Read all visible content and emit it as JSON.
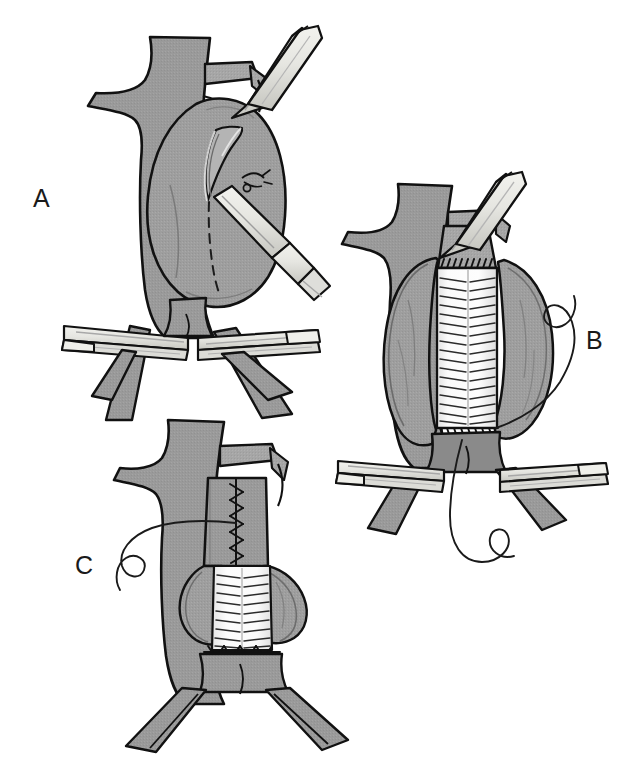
{
  "figure": {
    "background_color": "#ffffff",
    "width": 643,
    "height": 760,
    "style": "line-drawing medical illustration, grayscale"
  },
  "palette": {
    "vessel_fill": "#9a9a9a",
    "vessel_fill_light": "#a8a8a8",
    "vessel_shadow": "#8a8a8a",
    "sac_flap_fill": "#9e9e9e",
    "graft_fill": "#f6f6f6",
    "graft_shadow": "#d8d8d8",
    "instrument_fill": "#e8e8e4",
    "instrument_shadow": "#c9c9c4",
    "outline": "#111111",
    "suture": "#1a1a1a",
    "label_color": "#1a1a1a"
  },
  "panels": [
    {
      "id": "panel-a",
      "label": "A",
      "label_position": {
        "x": 33,
        "y": 186
      },
      "caption": "Aneurysm sac exposed with proximal aortic cross-clamp and bilateral iliac clamps; longitudinal aortotomy being made with scalpel along dashed incision line",
      "elements": [
        "proximal-aorta",
        "renal-artery-left",
        "renal-artery-right",
        "aneurysm-sac",
        "aortotomy-incision-dashed-line",
        "opened-aortotomy-edge",
        "scalpel",
        "proximal-aortic-clamp",
        "iliac-clamp-left",
        "iliac-clamp-right",
        "left-iliac-artery",
        "right-iliac-artery",
        "lumbar-vessel-ligature"
      ]
    },
    {
      "id": "panel-b",
      "label": "B",
      "label_position": {
        "x": 586,
        "y": 328
      },
      "caption": "Tube graft sewn in place inside the opened aneurysm sac; proximal and distal anastomoses completed with running suture, sac walls retracted laterally",
      "elements": [
        "proximal-aorta",
        "renal-artery-left",
        "renal-artery-right",
        "aneurysm-sac-flap-left",
        "aneurysm-sac-flap-right",
        "dacron-tube-graft",
        "proximal-anastomosis-suture-line",
        "distal-anastomosis-suture-line",
        "graft-corrugation-lines",
        "suture-with-needle-right",
        "suture-with-needle-bottom",
        "proximal-aortic-clamp",
        "iliac-clamp-left",
        "iliac-clamp-right",
        "aortic-bifurcation"
      ]
    },
    {
      "id": "panel-c",
      "label": "C",
      "label_position": {
        "x": 75,
        "y": 553
      },
      "caption": "Aneurysm sac closed over the graft with running suture; clamps removed, aortic bifurcation and iliac arteries restored",
      "elements": [
        "proximal-aorta",
        "renal-artery-right",
        "aneurysm-sac-closure-suture-line",
        "partially-closed-sac",
        "dacron-tube-graft-exposed",
        "graft-corrugation-lines",
        "distal-anastomosis-suture-line",
        "suture-with-needle-left",
        "left-iliac-artery",
        "right-iliac-artery",
        "aortic-bifurcation"
      ]
    }
  ],
  "labels": {
    "a": "A",
    "b": "B",
    "c": "C"
  }
}
